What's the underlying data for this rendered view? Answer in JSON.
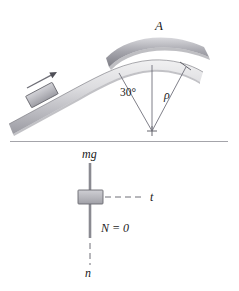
{
  "figure": {
    "upper_scene": {
      "point_label": "A",
      "angle_label": "30°",
      "radius_label": "ρ",
      "motion_arrow": "velocity-arrow"
    },
    "lower_scene": {
      "weight_label": "mg",
      "normal_label": "N = 0",
      "tangential_axis_label": "t",
      "normal_axis_label": "n"
    }
  },
  "colors": {
    "ink": "#1a1a1a",
    "line": "#6e6e78",
    "ramp_light": "#e2e2e4",
    "ramp_mid": "#bfbfc4",
    "ramp_dark": "#8c8c93",
    "block_fill": "#b9b9bf",
    "block_edge": "#6a6a70",
    "arc_dark": "#8f8f96",
    "divider": "#9a9aa0",
    "arrow": "#8a8a91"
  }
}
